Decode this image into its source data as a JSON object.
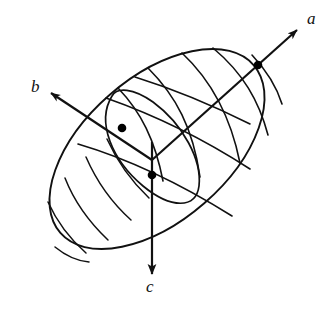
{
  "figure": {
    "background_color": "#ffffff",
    "stroke_color": "#111111",
    "dot_color": "#000000",
    "width": 335,
    "height": 316
  },
  "axes": [
    {
      "id": "a",
      "label": "a",
      "label_x": 309,
      "label_y": 12,
      "origin": [
        152,
        160
      ],
      "tip": [
        299,
        28
      ],
      "dot": [
        258,
        65
      ],
      "direction": "upper-right",
      "arrowhead": true
    },
    {
      "id": "b",
      "label": "b",
      "label_x": 33,
      "label_y": 80,
      "origin": [
        152,
        160
      ],
      "tip": [
        49,
        91
      ],
      "dot": [
        122,
        128
      ],
      "direction": "upper-left",
      "arrowhead": true
    },
    {
      "id": "c",
      "label": "c",
      "label_x": 146,
      "label_y": 283,
      "origin": [
        152,
        160
      ],
      "tip": [
        152,
        276
      ],
      "dot": [
        152,
        175
      ],
      "direction": "down",
      "arrowhead": true
    }
  ],
  "ellipsoid": {
    "center": [
      157,
      149
    ],
    "semi_major": 128,
    "semi_minor": 72,
    "rotation_deg": -41,
    "grid": {
      "meridians": 5,
      "latitudes": 4,
      "hatch_arcs": 6
    }
  },
  "dots": {
    "count": 3,
    "radius": 4.2,
    "labels": [
      "a-axis-intercept",
      "b-axis-intercept",
      "c-axis-intercept"
    ]
  }
}
